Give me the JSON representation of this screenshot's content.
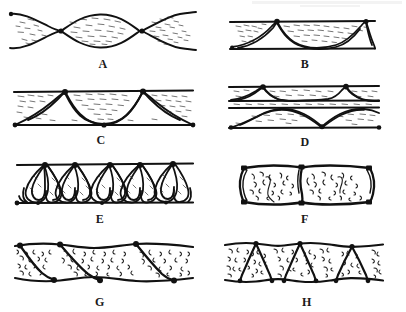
{
  "figure": {
    "width": 406,
    "height": 312,
    "background_color": "#ffffff",
    "ink_color": "#111111",
    "fill_color": "#ffffff",
    "hatch_color": "#1a1a1a",
    "panel_count": 8,
    "grid": {
      "columns": 2,
      "rows": 4
    }
  },
  "panels": [
    {
      "label": "A",
      "name": "panel-a",
      "description": "lens-shaped boudinage with pinch-and-swell necks, tapered wispy infill",
      "label_x": 103,
      "label_y": 58,
      "box": {
        "x": 8,
        "y": 6,
        "w": 190,
        "h": 50
      },
      "node_positions": [
        57,
        140
      ],
      "seed": 11
    },
    {
      "label": "B",
      "name": "panel-b",
      "description": "two straight horizontal boundaries with sagging catenary partitions hanging from an upper node",
      "label_x": 305,
      "label_y": 58,
      "box": {
        "x": 228,
        "y": 14,
        "w": 150,
        "h": 42
      },
      "node_positions": [
        80
      ],
      "seed": 23
    },
    {
      "label": "C",
      "name": "panel-c",
      "description": "parallel bands with arch and cusp partitions joining top and bottom nodes",
      "label_x": 101,
      "label_y": 134,
      "box": {
        "x": 12,
        "y": 84,
        "w": 184,
        "h": 48
      },
      "node_positions": [
        55,
        140
      ],
      "seed": 37
    },
    {
      "label": "D",
      "name": "panel-d",
      "description": "two stacked bands: thin upper band with pendant cusps, thicker lower band with domed swells",
      "label_x": 305,
      "label_y": 136,
      "box": {
        "x": 226,
        "y": 80,
        "w": 156,
        "h": 56
      },
      "node_positions": [
        60,
        135
      ],
      "seed": 53
    },
    {
      "label": "E",
      "name": "panel-e",
      "description": "dense vertical lenticular petal or leaf shapes stacked between two straight boundaries",
      "label_x": 100,
      "label_y": 213,
      "box": {
        "x": 14,
        "y": 158,
        "w": 182,
        "h": 52
      },
      "node_positions": [
        32,
        95,
        155
      ],
      "seed": 67
    },
    {
      "label": "F",
      "name": "panel-f",
      "description": "two blocky rectangular cells with outward bulging sides and heavy corner nodes",
      "label_x": 305,
      "label_y": 213,
      "box": {
        "x": 230,
        "y": 160,
        "w": 152,
        "h": 50
      },
      "node_positions": [
        76
      ],
      "seed": 79
    },
    {
      "label": "G",
      "name": "panel-g",
      "description": "band cut by inclined shear partitions forming oblique parallelogram domains",
      "label_x": 100,
      "label_y": 296,
      "box": {
        "x": 12,
        "y": 238,
        "w": 184,
        "h": 50
      },
      "node_positions": [
        50,
        120
      ],
      "seed": 91
    },
    {
      "label": "H",
      "name": "panel-h",
      "description": "band cut by alternating converging partitions making upright and inverted triangular domains",
      "label_x": 307,
      "label_y": 296,
      "box": {
        "x": 222,
        "y": 238,
        "w": 164,
        "h": 50
      },
      "node_positions": [
        40,
        82,
        124
      ],
      "seed": 103
    }
  ],
  "labels": {
    "a": "A",
    "b": "B",
    "c": "C",
    "d": "D",
    "e": "E",
    "f": "F",
    "g": "G",
    "h": "H"
  }
}
